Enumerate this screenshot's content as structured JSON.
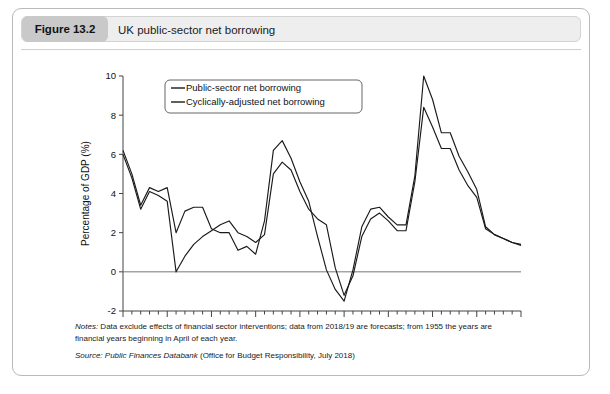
{
  "figure": {
    "number": "Figure 13.2",
    "title": "UK public-sector net borrowing"
  },
  "notes": {
    "lead": "Notes:",
    "line1": " Data exclude effects of financial sector interventions; data from 2018/19 are forecasts; from 1955 the years are",
    "line2": "financial years beginning in April of each year.",
    "source_lead": "Source:",
    "source_title": " Public Finances Databank",
    "source_rest": " (Office for Budget Responsibility, July 2018)"
  },
  "chart_data": {
    "type": "line",
    "title": "UK public-sector net borrowing",
    "xlabel": "",
    "ylabel": "Percentage of GDP (%)",
    "xlim": [
      1975,
      2020
    ],
    "ylim": [
      -2,
      10
    ],
    "ytick_values": [
      -2,
      0,
      2,
      4,
      6,
      8,
      10
    ],
    "ytick_labels": [
      "-2",
      "0",
      "2",
      "4",
      "6",
      "8",
      "10"
    ],
    "xtick_values": [
      1975,
      1980,
      1985,
      1990,
      1995,
      2000,
      2005,
      2010,
      2015,
      2020
    ],
    "xtick_labels": [
      "1975",
      "1980",
      "1985",
      "1990",
      "1995",
      "2000",
      "2005",
      "2010",
      "2015",
      "2020"
    ],
    "grid": false,
    "legend_position": "upper-left",
    "zero_line": 0,
    "line_color": "#1a1a1a",
    "x": [
      1975,
      1976,
      1977,
      1978,
      1979,
      1980,
      1981,
      1982,
      1983,
      1984,
      1985,
      1986,
      1987,
      1988,
      1989,
      1990,
      1991,
      1992,
      1993,
      1994,
      1995,
      1996,
      1997,
      1998,
      1999,
      2000,
      2001,
      2002,
      2003,
      2004,
      2005,
      2006,
      2007,
      2008,
      2009,
      2010,
      2011,
      2012,
      2013,
      2014,
      2015,
      2016,
      2017,
      2018,
      2019,
      2020
    ],
    "series": [
      {
        "name": "Public-sector net borrowing",
        "values": [
          6.2,
          5.0,
          3.4,
          4.3,
          4.1,
          4.3,
          2.0,
          3.1,
          3.3,
          3.3,
          2.2,
          2.0,
          2.0,
          1.1,
          1.3,
          0.9,
          2.6,
          6.2,
          6.7,
          5.8,
          4.6,
          3.6,
          1.8,
          0.1,
          -0.9,
          -1.5,
          0.1,
          2.3,
          3.2,
          3.3,
          2.8,
          2.4,
          2.4,
          4.9,
          10.0,
          8.8,
          7.1,
          7.1,
          5.9,
          5.1,
          4.2,
          2.3,
          1.9,
          1.7,
          1.5,
          1.4
        ]
      },
      {
        "name": "Cyclically-adjusted net borrowing",
        "values": [
          6.0,
          4.8,
          3.2,
          4.1,
          3.9,
          3.6,
          0.0,
          0.8,
          1.4,
          1.8,
          2.1,
          2.4,
          2.6,
          2.0,
          1.8,
          1.5,
          1.9,
          5.0,
          5.6,
          5.2,
          4.1,
          3.2,
          2.7,
          2.4,
          0.2,
          -1.2,
          -0.2,
          1.8,
          2.7,
          3.0,
          2.6,
          2.1,
          2.1,
          4.6,
          8.4,
          7.4,
          6.3,
          6.3,
          5.2,
          4.4,
          3.8,
          2.2,
          1.9,
          1.7,
          1.5,
          1.35
        ]
      }
    ],
    "legend": [
      "Public-sector net borrowing",
      "Cyclically-adjusted net borrowing"
    ]
  }
}
